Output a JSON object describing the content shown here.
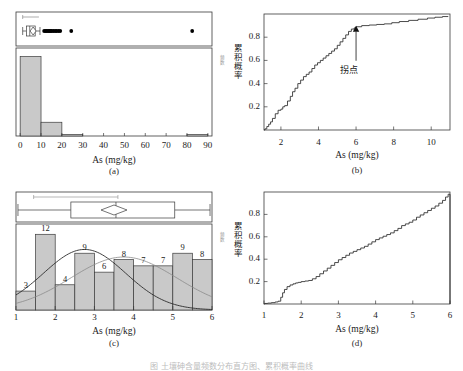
{
  "figure": {
    "caption": "图 土壤砷含量频数分布直方图、累积概率曲线",
    "panel_labels": [
      "(a)",
      "(b)",
      "(c)",
      "(d)"
    ]
  },
  "colors": {
    "bar_fill": "#c9c9c9",
    "bar_stroke": "#3a3a3a",
    "axis": "#3a3a3a",
    "curve_dark": "#2a2a2a",
    "curve_light": "#8a8a8a",
    "dot": "#000000",
    "text": "#1a1a1a"
  },
  "panel_a": {
    "label": "(a)",
    "xlabel": "As (mg/kg)",
    "ylabel_side": "频数",
    "xticks": [
      0,
      10,
      20,
      30,
      40,
      50,
      60,
      70,
      80,
      90
    ],
    "xlim": [
      -2,
      92
    ],
    "chart_data": {
      "type": "bar",
      "title": "",
      "xlabel": "As (mg/kg)",
      "ylabel": "频数",
      "categories": [
        "0-10",
        "10-20",
        "20-30",
        "30-40",
        "40-50",
        "50-60",
        "60-70",
        "70-80",
        "80-90"
      ],
      "bin_edges": [
        0,
        10,
        20,
        30,
        40,
        50,
        60,
        70,
        80,
        90
      ],
      "values": [
        52,
        9,
        1,
        0,
        0,
        0,
        0,
        0,
        1
      ],
      "ylim": [
        0,
        55
      ],
      "grid": false
    },
    "boxplot": {
      "whisker_low": 1.2,
      "q1": 3.0,
      "median": 4.6,
      "mean": 6.2,
      "q3": 7.2,
      "whisker_high": 9.5,
      "confidence_bar_low": 1.2,
      "confidence_bar_high": 9.0,
      "outliers": [
        11.5,
        12.2,
        12.8,
        13.4,
        14.0,
        14.6,
        15.2,
        16.0,
        16.8,
        17.5,
        18.4,
        19.2,
        24.5,
        82.5
      ]
    }
  },
  "panel_b": {
    "label": "(b)",
    "xlabel": "As (mg/kg)",
    "ylabel": "累积概率",
    "annotation": "拐点",
    "xticks": [
      2,
      4,
      6,
      8,
      10
    ],
    "yticks": [
      0.2,
      0.4,
      0.6,
      0.8
    ],
    "chart_data": {
      "type": "line",
      "title": "",
      "xlabel": "As (mg/kg)",
      "ylabel": "累积概率",
      "xlim": [
        1.1,
        11.0
      ],
      "ylim": [
        0.0,
        1.0
      ],
      "grid": false,
      "annotations": [
        {
          "text": "拐点",
          "x": 6.0,
          "y": 0.89
        }
      ],
      "series": [
        {
          "name": "累积概率",
          "x": [
            1.15,
            1.25,
            1.35,
            1.45,
            1.55,
            1.7,
            1.85,
            2.0,
            2.1,
            2.2,
            2.35,
            2.5,
            2.62,
            2.75,
            2.9,
            3.05,
            3.2,
            3.35,
            3.5,
            3.65,
            3.8,
            3.95,
            4.1,
            4.25,
            4.4,
            4.55,
            4.7,
            4.85,
            5.0,
            5.15,
            5.3,
            5.45,
            5.6,
            5.75,
            5.9,
            6.0,
            6.3,
            6.7,
            7.1,
            7.5,
            7.9,
            8.3,
            8.8,
            9.3,
            9.8,
            10.2,
            10.6,
            10.9
          ],
          "y": [
            0.01,
            0.03,
            0.05,
            0.07,
            0.1,
            0.14,
            0.17,
            0.18,
            0.2,
            0.21,
            0.25,
            0.29,
            0.33,
            0.36,
            0.4,
            0.43,
            0.46,
            0.48,
            0.5,
            0.53,
            0.56,
            0.58,
            0.6,
            0.62,
            0.64,
            0.66,
            0.68,
            0.7,
            0.73,
            0.76,
            0.79,
            0.82,
            0.85,
            0.87,
            0.88,
            0.89,
            0.9,
            0.905,
            0.91,
            0.915,
            0.925,
            0.935,
            0.945,
            0.955,
            0.965,
            0.972,
            0.978,
            0.98
          ]
        }
      ]
    }
  },
  "panel_c": {
    "label": "(c)",
    "xlabel": "As (mg/kg)",
    "ylabel_side": "频数",
    "xticks": [
      1,
      2,
      3,
      4,
      5,
      6
    ],
    "chart_data": {
      "type": "bar",
      "title": "",
      "xlabel": "As (mg/kg)",
      "ylabel": "频数",
      "categories": [
        "1.0-1.5",
        "1.5-2.0",
        "2.0-2.5",
        "2.5-3.0",
        "3.0-3.5",
        "3.5-4.0",
        "4.0-4.5",
        "4.5-5.0",
        "5.0-5.5",
        "5.5-6.0"
      ],
      "bin_edges": [
        1.0,
        1.5,
        2.0,
        2.5,
        3.0,
        3.5,
        4.0,
        4.5,
        5.0,
        5.5,
        6.0
      ],
      "values": [
        3,
        12,
        4,
        9,
        6,
        8,
        7,
        7,
        9,
        8
      ],
      "bar_labels": [
        "3",
        "12",
        "4",
        "9",
        "6",
        "8",
        "7",
        "7",
        "9",
        "8"
      ],
      "ylim": [
        0,
        13
      ],
      "grid": false,
      "overlays": [
        {
          "name": "normal-fit",
          "style": "dark"
        },
        {
          "name": "kernel-fit",
          "style": "light"
        }
      ]
    },
    "boxplot": {
      "whisker_low": 1.05,
      "q1": 2.4,
      "median": 3.55,
      "mean": 3.5,
      "q3": 5.05,
      "whisker_high": 5.95,
      "confidence_bar_low": 1.45,
      "confidence_bar_high": 3.6
    }
  },
  "panel_d": {
    "label": "(d)",
    "xlabel": "As (mg/kg)",
    "ylabel": "累积概率",
    "xticks": [
      1,
      2,
      3,
      4,
      5,
      6
    ],
    "yticks": [
      0.2,
      0.4,
      0.6,
      0.8
    ],
    "chart_data": {
      "type": "line",
      "title": "",
      "xlabel": "As (mg/kg)",
      "ylabel": "累积概率",
      "xlim": [
        1.0,
        6.0
      ],
      "ylim": [
        0.0,
        1.0
      ],
      "grid": false,
      "series": [
        {
          "name": "累积概率",
          "x": [
            1.02,
            1.1,
            1.2,
            1.3,
            1.38,
            1.45,
            1.5,
            1.55,
            1.62,
            1.7,
            1.78,
            1.85,
            1.92,
            2.0,
            2.1,
            2.2,
            2.3,
            2.4,
            2.5,
            2.6,
            2.7,
            2.8,
            2.9,
            3.0,
            3.1,
            3.2,
            3.3,
            3.4,
            3.5,
            3.6,
            3.7,
            3.8,
            3.9,
            4.0,
            4.1,
            4.2,
            4.3,
            4.4,
            4.5,
            4.6,
            4.7,
            4.8,
            4.9,
            5.0,
            5.1,
            5.2,
            5.3,
            5.4,
            5.5,
            5.6,
            5.7,
            5.8,
            5.88,
            5.95
          ],
          "y": [
            0.005,
            0.008,
            0.012,
            0.018,
            0.025,
            0.06,
            0.1,
            0.13,
            0.155,
            0.17,
            0.18,
            0.188,
            0.193,
            0.2,
            0.205,
            0.21,
            0.225,
            0.245,
            0.27,
            0.295,
            0.32,
            0.345,
            0.37,
            0.395,
            0.415,
            0.435,
            0.455,
            0.47,
            0.485,
            0.5,
            0.515,
            0.535,
            0.555,
            0.575,
            0.59,
            0.605,
            0.62,
            0.635,
            0.655,
            0.675,
            0.7,
            0.715,
            0.73,
            0.75,
            0.775,
            0.795,
            0.815,
            0.835,
            0.855,
            0.875,
            0.9,
            0.925,
            0.955,
            0.98
          ]
        }
      ]
    }
  }
}
